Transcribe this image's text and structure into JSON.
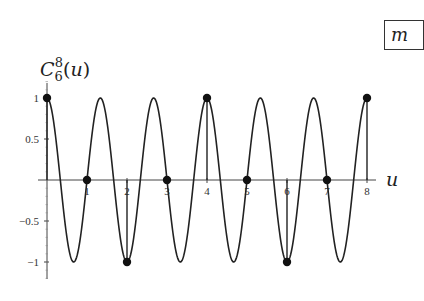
{
  "chart_data": {
    "type": "line",
    "title": "",
    "ylabel": "C_6^8(u)",
    "ylabel_display": {
      "base": "C",
      "sub": "6",
      "sup": "8",
      "arg": "(u)"
    },
    "xlabel": "u",
    "function": "cos(3*pi*u/2)",
    "xlim": [
      0,
      8
    ],
    "ylim": [
      -1,
      1
    ],
    "x_ticks": [
      1,
      2,
      3,
      4,
      5,
      6,
      7,
      8
    ],
    "x_tick_labels": [
      "1",
      "2",
      "3",
      "4",
      "5",
      "6",
      "7",
      "8"
    ],
    "y_ticks": [
      1,
      0.5,
      -0.5,
      -1
    ],
    "y_tick_labels": [
      "1",
      "0.5",
      "−0.5",
      "−1"
    ],
    "grid": false,
    "series": [
      {
        "name": "C_6^8(u) continuous",
        "style": "line",
        "x": [
          0,
          0.6667,
          1.3333,
          2,
          2.6667,
          3.3333,
          4,
          4.6667,
          5.3333,
          6,
          6.6667,
          7.3333,
          8
        ],
        "values": [
          1,
          -1,
          1,
          -1,
          1,
          -1,
          1,
          -1,
          1,
          -1,
          1,
          -1,
          1
        ]
      },
      {
        "name": "samples at integer u",
        "style": "stem-dots",
        "x": [
          0,
          1,
          2,
          3,
          4,
          5,
          6,
          7,
          8
        ],
        "values": [
          1,
          0,
          -1,
          0,
          1,
          0,
          -1,
          0,
          1
        ]
      }
    ],
    "annotations": [
      {
        "text": "m",
        "position": "top-right boxed, clipped"
      }
    ]
  },
  "labels": {
    "y_base": "C",
    "y_sub": "6",
    "y_sup": "8",
    "y_arg": "(u)",
    "x_axis": "u",
    "box_text": "m"
  }
}
